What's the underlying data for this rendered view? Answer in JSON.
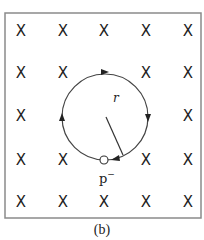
{
  "figure": {
    "caption": "(b)",
    "field_symbol": "X",
    "field_grid": {
      "rows": 5,
      "cols": 5,
      "xs": [
        21,
        63,
        104,
        146,
        188
      ],
      "ys": [
        31,
        73,
        116,
        160,
        202
      ]
    },
    "particle_label": "p",
    "particle_charge": "−",
    "radius_label": "r",
    "orbit_direction": "clockwise",
    "colors": {
      "line": "#333333",
      "border": "#888888",
      "text": "#222222"
    }
  }
}
